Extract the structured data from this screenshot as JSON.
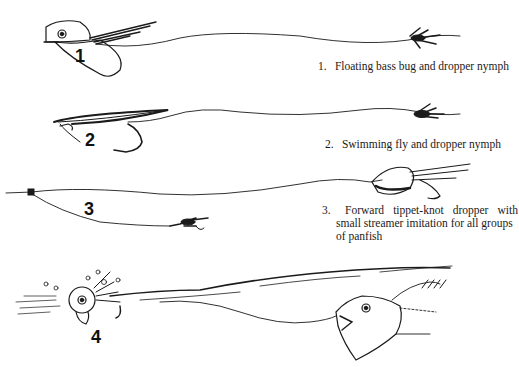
{
  "figure": {
    "items": [
      {
        "number": "1",
        "caption_number": "1.",
        "caption": "Floating bass bug and dropper nymph",
        "lure": "floating-bass-bug",
        "dropper": "nymph"
      },
      {
        "number": "2",
        "caption_number": "2.",
        "caption": "Swimming fly and dropper nymph",
        "lure": "swimming-fly",
        "dropper": "nymph"
      },
      {
        "number": "3",
        "caption_number": "3.",
        "caption_lines": [
          "Forward tippet-knot dropper with",
          "small streamer imitation for all groups",
          "of panfish"
        ],
        "caption_words_line1": [
          "Forward",
          "tippet-knot",
          "dropper",
          "with"
        ],
        "lure": "popper",
        "dropper": "small-streamer"
      },
      {
        "number": "4",
        "lure": "popper-splashing",
        "target": "panfish-striking"
      }
    ],
    "colors": {
      "ink": "#1a1a1a",
      "background": "#ffffff"
    }
  }
}
